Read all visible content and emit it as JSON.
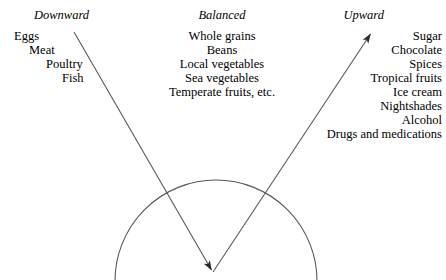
{
  "diagram": {
    "type": "yin-yang-food-classification",
    "background_color": "#ffffff",
    "stroke_color": "#2b2b2b",
    "columns": [
      {
        "id": "downward",
        "heading": "Downward",
        "align": "staircase-right",
        "items": [
          "Eggs",
          "Meat",
          "Poultry",
          "Fish"
        ]
      },
      {
        "id": "balanced",
        "heading": "Balanced",
        "align": "center",
        "items": [
          "Whole grains",
          "Beans",
          "Local vegetables",
          "Sea vegetables",
          "Temperate fruits, etc."
        ]
      },
      {
        "id": "upward",
        "heading": "Upward",
        "align": "right",
        "items": [
          "Sugar",
          "Chocolate",
          "Spices",
          "Tropical fruits",
          "Ice cream",
          "Nightshades",
          "Alcohol",
          "Drugs and medications"
        ]
      }
    ],
    "shapes": {
      "downward_arrow": {
        "name": "downward-arrow",
        "from_x": 74,
        "from_y": 32,
        "to_x": 213,
        "to_y": 272,
        "arrowhead_at": "end"
      },
      "upward_arrow": {
        "name": "upward-arrow",
        "from_x": 213,
        "from_y": 272,
        "to_x": 372,
        "to_y": 32,
        "arrowhead_at": "end"
      },
      "arc": {
        "name": "semicircular-arc",
        "center_x": 216,
        "center_y": 279,
        "radius": 101,
        "start_x": 115,
        "start_y": 279,
        "end_x": 317,
        "end_y": 279
      }
    }
  }
}
